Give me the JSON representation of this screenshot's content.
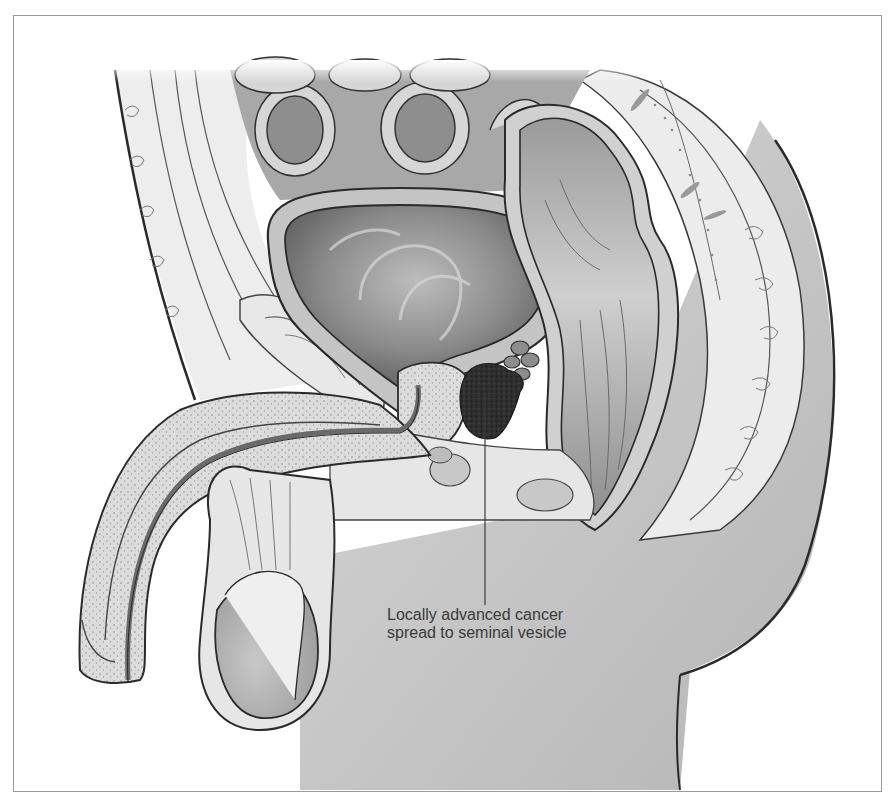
{
  "figure": {
    "callout": {
      "lines": [
        "Locally advanced cancer",
        "spread to seminal vesicle"
      ],
      "leader_x": 485,
      "leader_y_top": 395,
      "leader_y_bottom": 605
    },
    "structures": [
      {
        "id": "small-intestine-loops",
        "shade": "#9a9a9a"
      },
      {
        "id": "bladder",
        "shade": "#7a7a7a"
      },
      {
        "id": "pubic-bone",
        "shade": "#e2e2e2"
      },
      {
        "id": "prostate",
        "shade": "#c9c9c9"
      },
      {
        "id": "tumor-seminal-vesicle",
        "shade": "#2e2e2e"
      },
      {
        "id": "seminal-vesicle",
        "shade": "#8a8a8a"
      },
      {
        "id": "rectum",
        "shade": "#a5a5a5"
      },
      {
        "id": "urethra",
        "shade": "#6a6a6a"
      },
      {
        "id": "penis",
        "shade": "#d4d4d4"
      },
      {
        "id": "testis",
        "shade": "#b0b0b0"
      },
      {
        "id": "sacrum-coccyx",
        "shade": "#e6e6e6"
      },
      {
        "id": "buttock-skin",
        "shade": "#c2c2c2"
      }
    ],
    "colors": {
      "outline": "#2a2a2a",
      "frame": "#9a9a9a",
      "label_text": "#3a3a3a",
      "background": "#ffffff"
    }
  }
}
